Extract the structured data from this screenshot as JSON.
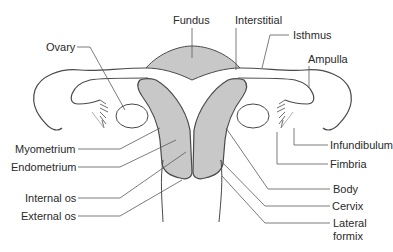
{
  "diagram": {
    "colors": {
      "fill": "#c8c8c8",
      "outline": "#4a4a4a",
      "leader": "#5a5a5a",
      "text": "#2a2a2a",
      "background": "#ffffff"
    },
    "labels": {
      "fundus": "Fundus",
      "interstitial": "Interstitial",
      "isthmus": "Isthmus",
      "ampulla": "Ampulla",
      "ovary": "Ovary",
      "infundibulum": "Infundibulum",
      "fimbria": "Fimbria",
      "myometrium": "Myometrium",
      "endometrium": "Endometrium",
      "internal_os": "Internal os",
      "external_os": "External os",
      "body": "Body",
      "cervix": "Cervix",
      "lateral_formix_line1": "Lateral",
      "lateral_formix_line2": "formix"
    }
  }
}
